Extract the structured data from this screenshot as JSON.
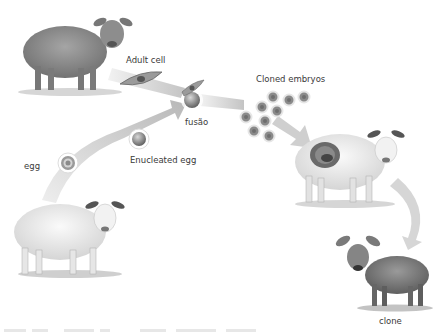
{
  "diagram": {
    "colors": {
      "background": "#ffffff",
      "arrow": "#c8c8c8",
      "cell": "#8a8a8a",
      "text": "#3a3a3a"
    },
    "labels": {
      "adult_cell": "Adult cell",
      "fusion": "fusão",
      "cloned_embryos": "Cloned embryos",
      "egg": "egg",
      "enucleated_egg": "Enucleated egg",
      "clone": "clone"
    },
    "nodes": [
      {
        "id": "donor-sheep",
        "desc": "Adult donor sheep (gray)"
      },
      {
        "id": "adult-cell",
        "desc": "Adult body cell"
      },
      {
        "id": "egg-donor-sheep",
        "desc": "White egg donor sheep"
      },
      {
        "id": "egg",
        "desc": "Egg cell"
      },
      {
        "id": "enucleated-egg",
        "desc": "Egg with nucleus removed"
      },
      {
        "id": "fusion",
        "desc": "Fusion of adult cell and enucleated egg"
      },
      {
        "id": "cloned-embryos",
        "desc": "Cluster of 9 cloned embryos"
      },
      {
        "id": "surrogate-sheep",
        "desc": "Surrogate mother with embryo in womb"
      },
      {
        "id": "clone-lamb",
        "desc": "Cloned lamb"
      }
    ]
  }
}
